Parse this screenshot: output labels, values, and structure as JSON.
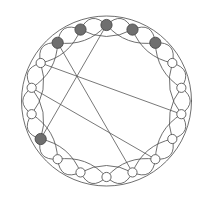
{
  "figure": {
    "background_color": "#ffffff",
    "edge_color": "#555555",
    "filled_node_color": "#6f6f6f",
    "open_node_color": "#ffffff",
    "node_stroke_color": "#4a4a4a",
    "node_count": 18,
    "filled_node_count": 6,
    "open_node_count": 12,
    "center": {
      "x": 106.5,
      "y": 101.0
    },
    "ring_radius": 76.0,
    "node_radius_filled": 5.6,
    "node_radius_open": 4.6,
    "chord_hub": {
      "x": 71.0,
      "y": 124.0
    },
    "arc_steps": [
      1,
      2
    ],
    "arc_bulge_step1": 9.0,
    "arc_bulge_step2": -7.0,
    "start_angle_deg": -90,
    "nodes": [
      {
        "id": 0,
        "angle_deg": -90,
        "state": "filled"
      },
      {
        "id": 1,
        "angle_deg": -70,
        "state": "filled"
      },
      {
        "id": 2,
        "angle_deg": -50,
        "state": "filled"
      },
      {
        "id": 3,
        "angle_deg": -30,
        "state": "open"
      },
      {
        "id": 4,
        "angle_deg": -10,
        "state": "open"
      },
      {
        "id": 5,
        "angle_deg": 10,
        "state": "open"
      },
      {
        "id": 6,
        "angle_deg": 30,
        "state": "open"
      },
      {
        "id": 7,
        "angle_deg": 50,
        "state": "open"
      },
      {
        "id": 8,
        "angle_deg": 70,
        "state": "open"
      },
      {
        "id": 9,
        "angle_deg": 90,
        "state": "open"
      },
      {
        "id": 10,
        "angle_deg": 110,
        "state": "open"
      },
      {
        "id": 11,
        "angle_deg": 130,
        "state": "open"
      },
      {
        "id": 12,
        "angle_deg": 150,
        "state": "filled"
      },
      {
        "id": 13,
        "angle_deg": 170,
        "state": "open"
      },
      {
        "id": 14,
        "angle_deg": -170,
        "state": "open"
      },
      {
        "id": 15,
        "angle_deg": -150,
        "state": "open"
      },
      {
        "id": 16,
        "angle_deg": -130,
        "state": "filled"
      },
      {
        "id": 17,
        "angle_deg": -110,
        "state": "filled"
      }
    ],
    "chords": [
      {
        "from": 0,
        "to": 12,
        "label": "chord-top-to-lowerleft"
      },
      {
        "from": 5,
        "to": 15,
        "label": "chord-right-to-left"
      },
      {
        "from": 8,
        "to": 16,
        "label": "chord-lowerright-to-upperleft"
      },
      {
        "from": 14,
        "to": 7,
        "label": "chord-left-to-lowerright"
      }
    ]
  }
}
